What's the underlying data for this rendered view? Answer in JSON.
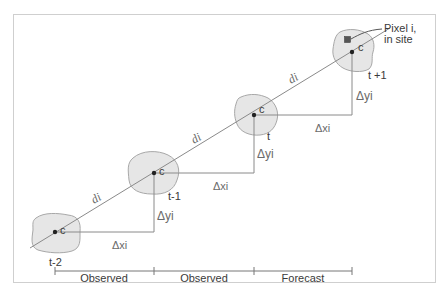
{
  "diagram": {
    "colors": {
      "frame": "#c8c8c8",
      "line": "#8a8a8a",
      "blob_fill": "#e6e6e6",
      "blob_stroke": "#a8a8a8",
      "centroid": "#222222",
      "pixel_marker": "#555555",
      "text": "#3a3a3a"
    },
    "sites": [
      {
        "id": "t-2",
        "time_label": "t-2",
        "centroid_label": "c"
      },
      {
        "id": "t-1",
        "time_label": "t-1",
        "centroid_label": "c"
      },
      {
        "id": "t",
        "time_label": "t",
        "centroid_label": "c"
      },
      {
        "id": "t+1",
        "time_label": "t +1",
        "centroid_label": "c"
      }
    ],
    "segments": [
      {
        "distance_label": "di",
        "dx_label": "Δxi",
        "dy_label": "Δyi"
      },
      {
        "distance_label": "di",
        "dx_label": "Δxi",
        "dy_label": "Δyi"
      },
      {
        "distance_label": "di",
        "dx_label": "Δxi",
        "dy_label": "Δyi"
      }
    ],
    "pixel_annotation": {
      "line1": "Pixel  i,",
      "line2": "in site"
    },
    "timeline": {
      "segments": [
        "Observed",
        "Observed",
        "Forecast"
      ]
    }
  }
}
